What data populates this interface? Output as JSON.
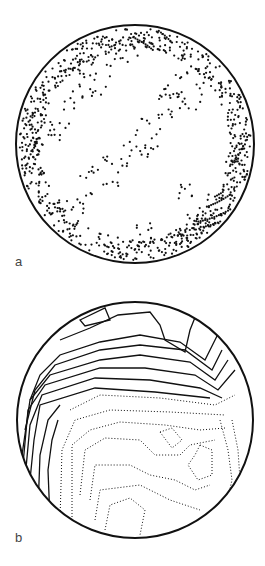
{
  "figure": {
    "panels": [
      {
        "id": "a",
        "label": "a",
        "type": "point plot on stereographic projection (stereonet)",
        "description": "scatter of dots densest along the perimeter with clusters in interior"
      },
      {
        "id": "b",
        "label": "b",
        "type": "contoured stereonet",
        "description": "solid contour lines upper-left/top, dotted contour lines elsewhere"
      }
    ],
    "caption_partial": "",
    "colors": {
      "ink": "#111111",
      "background": "#ffffff",
      "label": "#444444"
    }
  }
}
